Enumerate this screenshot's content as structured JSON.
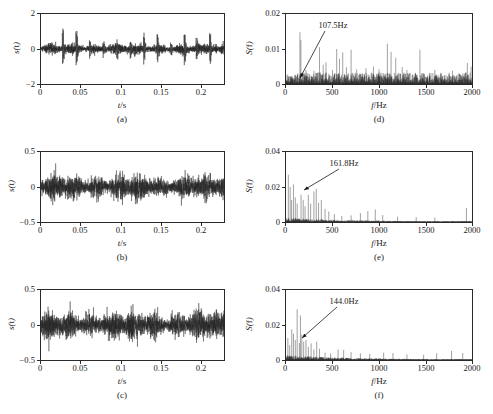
{
  "figure": {
    "layout": "2 columns x 3 rows",
    "columns": [
      "time-domain",
      "frequency-spectrum"
    ]
  },
  "axis_titles": {
    "time_x": "t",
    "time_x_unit": "/s",
    "time_y": "s(t)",
    "freq_x": "f",
    "freq_x_unit": "/Hz",
    "freq_y": "S(f)"
  },
  "captions": {
    "a": "(a)",
    "b": "(b)",
    "c": "(c)",
    "d": "(d)",
    "e": "(e)",
    "f": "(f)"
  },
  "ticks": {
    "time_x": [
      "0",
      "0.05",
      "0.1",
      "0.15",
      "0.2"
    ],
    "freq_x": [
      "0",
      "500",
      "1000",
      "1500",
      "2000"
    ],
    "y_a": [
      "2",
      "0",
      "−2"
    ],
    "y_b": [
      "0.5",
      "0",
      "−0.5"
    ],
    "y_c": [
      "0.5",
      "0",
      "−0.5"
    ],
    "y_d": [
      "0.02",
      "0.01",
      "0"
    ],
    "y_e": [
      "0.04",
      "0.02",
      "0"
    ],
    "y_f": [
      "0.04",
      "0.02",
      "0"
    ]
  },
  "annotations": {
    "d": "107.5Hz",
    "e": "161.8Hz",
    "f": "144.0Hz"
  },
  "colors": {
    "trace": "#262626",
    "axis": "#2a2a2a",
    "background": "#ffffff"
  },
  "chart_data": [
    {
      "id": "a",
      "type": "line",
      "title": "(a)",
      "xlabel": "t/s",
      "ylabel": "s(t)",
      "xlim": [
        0,
        0.23
      ],
      "ylim": [
        -2,
        2
      ],
      "xticks": [
        0,
        0.05,
        0.1,
        0.15,
        0.2
      ],
      "yticks": [
        -2,
        0,
        2
      ],
      "grid": false,
      "legend": "none",
      "description": "Raw vibration signal with periodic impulsive bursts",
      "envelope_peak_times": [
        0.028,
        0.045,
        0.062,
        0.079,
        0.096,
        0.113,
        0.13,
        0.147,
        0.164,
        0.181,
        0.196,
        0.213
      ],
      "envelope_peak_amplitudes": [
        1.25,
        1.45,
        0.55,
        0.62,
        0.7,
        0.52,
        0.9,
        0.95,
        0.48,
        1.1,
        0.7,
        1.05
      ],
      "background_noise_amplitude": 0.28,
      "impulse_period_s": 0.0171
    },
    {
      "id": "b",
      "type": "line",
      "title": "(b)",
      "xlabel": "t/s",
      "ylabel": "s(t)",
      "xlim": [
        0,
        0.23
      ],
      "ylim": [
        -0.5,
        0.5
      ],
      "xticks": [
        0,
        0.05,
        0.1,
        0.15,
        0.2
      ],
      "yticks": [
        -0.5,
        0,
        0.5
      ],
      "grid": false,
      "legend": "none",
      "description": "Noisy signal, fault impulses masked by random noise",
      "background_noise_amplitude": 0.17,
      "max_abs_amplitude": 0.4
    },
    {
      "id": "c",
      "type": "line",
      "title": "(c)",
      "xlabel": "t/s",
      "ylabel": "s(t)",
      "xlim": [
        0,
        0.23
      ],
      "ylim": [
        -0.5,
        0.5
      ],
      "xticks": [
        0,
        0.05,
        0.1,
        0.15,
        0.2
      ],
      "yticks": [
        -0.5,
        0,
        0.5
      ],
      "grid": false,
      "legend": "none",
      "description": "Noisy signal with broadband random content",
      "background_noise_amplitude": 0.19,
      "max_abs_amplitude": 0.43
    },
    {
      "id": "d",
      "type": "line",
      "title": "(d)",
      "xlabel": "f/Hz",
      "ylabel": "S(f)",
      "xlim": [
        0,
        2000
      ],
      "ylim": [
        0,
        0.02
      ],
      "xticks": [
        0,
        500,
        1000,
        1500,
        2000
      ],
      "yticks": [
        0,
        0.01,
        0.02
      ],
      "grid": false,
      "legend": "none",
      "annotation": "107.5Hz",
      "annotation_frequency": 107.5,
      "description": "Spectrum with discrete peaks spread across full 0-2000 Hz band",
      "peaks": [
        {
          "f": 107.5,
          "a": 0.0022
        },
        {
          "f": 150,
          "a": 0.0148
        },
        {
          "f": 160,
          "a": 0.0125
        },
        {
          "f": 215,
          "a": 0.004
        },
        {
          "f": 300,
          "a": 0.0038
        },
        {
          "f": 360,
          "a": 0.0105
        },
        {
          "f": 400,
          "a": 0.0055
        },
        {
          "f": 430,
          "a": 0.0062
        },
        {
          "f": 500,
          "a": 0.004
        },
        {
          "f": 545,
          "a": 0.01
        },
        {
          "f": 575,
          "a": 0.0072
        },
        {
          "f": 610,
          "a": 0.009
        },
        {
          "f": 650,
          "a": 0.0048
        },
        {
          "f": 700,
          "a": 0.0098
        },
        {
          "f": 760,
          "a": 0.0042
        },
        {
          "f": 860,
          "a": 0.0045
        },
        {
          "f": 940,
          "a": 0.005
        },
        {
          "f": 1000,
          "a": 0.0042
        },
        {
          "f": 1090,
          "a": 0.0115
        },
        {
          "f": 1130,
          "a": 0.0092
        },
        {
          "f": 1180,
          "a": 0.0075
        },
        {
          "f": 1250,
          "a": 0.0048
        },
        {
          "f": 1300,
          "a": 0.004
        },
        {
          "f": 1440,
          "a": 0.0098
        },
        {
          "f": 1600,
          "a": 0.004
        },
        {
          "f": 1790,
          "a": 0.0038
        },
        {
          "f": 1950,
          "a": 0.006
        },
        {
          "f": 1990,
          "a": 0.005
        }
      ],
      "noise_floor": 0.0016
    },
    {
      "id": "e",
      "type": "line",
      "title": "(e)",
      "xlabel": "f/Hz",
      "ylabel": "S(f)",
      "xlim": [
        0,
        2000
      ],
      "ylim": [
        0,
        0.04
      ],
      "xticks": [
        0,
        500,
        1000,
        1500,
        2000
      ],
      "yticks": [
        0,
        0.02,
        0.04
      ],
      "grid": false,
      "legend": "none",
      "annotation": "161.8Hz",
      "annotation_frequency": 161.8,
      "description": "Spectrum with energy concentrated below 500 Hz",
      "peaks": [
        {
          "f": 25,
          "a": 0.027
        },
        {
          "f": 45,
          "a": 0.02
        },
        {
          "f": 60,
          "a": 0.0125
        },
        {
          "f": 80,
          "a": 0.0215
        },
        {
          "f": 100,
          "a": 0.014
        },
        {
          "f": 120,
          "a": 0.0105
        },
        {
          "f": 161.8,
          "a": 0.0155
        },
        {
          "f": 185,
          "a": 0.0125
        },
        {
          "f": 205,
          "a": 0.009
        },
        {
          "f": 240,
          "a": 0.0155
        },
        {
          "f": 265,
          "a": 0.0105
        },
        {
          "f": 300,
          "a": 0.0175
        },
        {
          "f": 325,
          "a": 0.019
        },
        {
          "f": 350,
          "a": 0.011
        },
        {
          "f": 380,
          "a": 0.0125
        },
        {
          "f": 420,
          "a": 0.0075
        },
        {
          "f": 460,
          "a": 0.006
        },
        {
          "f": 520,
          "a": 0.0045
        },
        {
          "f": 600,
          "a": 0.0035
        },
        {
          "f": 700,
          "a": 0.0038
        },
        {
          "f": 800,
          "a": 0.005
        },
        {
          "f": 880,
          "a": 0.0062
        },
        {
          "f": 960,
          "a": 0.0072
        },
        {
          "f": 1040,
          "a": 0.004
        },
        {
          "f": 1200,
          "a": 0.003
        },
        {
          "f": 1400,
          "a": 0.0028
        },
        {
          "f": 1600,
          "a": 0.0025
        },
        {
          "f": 1940,
          "a": 0.008
        }
      ],
      "noise_floor": 0.0012
    },
    {
      "id": "f",
      "type": "line",
      "title": "(f)",
      "xlabel": "f/Hz",
      "ylabel": "S(f)",
      "xlim": [
        0,
        2000
      ],
      "ylim": [
        0,
        0.04
      ],
      "xticks": [
        0,
        500,
        1000,
        1500,
        2000
      ],
      "yticks": [
        0,
        0.02,
        0.04
      ],
      "grid": false,
      "legend": "none",
      "annotation": "144.0Hz",
      "annotation_frequency": 144.0,
      "description": "Spectrum with dominant low-frequency peaks below 400 Hz",
      "peaks": [
        {
          "f": 20,
          "a": 0.0125
        },
        {
          "f": 40,
          "a": 0.0085
        },
        {
          "f": 62,
          "a": 0.0175
        },
        {
          "f": 80,
          "a": 0.015
        },
        {
          "f": 100,
          "a": 0.0115
        },
        {
          "f": 120,
          "a": 0.029
        },
        {
          "f": 144,
          "a": 0.0098
        },
        {
          "f": 155,
          "a": 0.0255
        },
        {
          "f": 170,
          "a": 0.0145
        },
        {
          "f": 190,
          "a": 0.0105
        },
        {
          "f": 215,
          "a": 0.0115
        },
        {
          "f": 240,
          "a": 0.0075
        },
        {
          "f": 270,
          "a": 0.0095
        },
        {
          "f": 300,
          "a": 0.006
        },
        {
          "f": 330,
          "a": 0.0105
        },
        {
          "f": 360,
          "a": 0.0065
        },
        {
          "f": 420,
          "a": 0.0042
        },
        {
          "f": 480,
          "a": 0.0038
        },
        {
          "f": 560,
          "a": 0.006
        },
        {
          "f": 620,
          "a": 0.0058
        },
        {
          "f": 700,
          "a": 0.0045
        },
        {
          "f": 800,
          "a": 0.0038
        },
        {
          "f": 900,
          "a": 0.0035
        },
        {
          "f": 1050,
          "a": 0.0042
        },
        {
          "f": 1150,
          "a": 0.004
        },
        {
          "f": 1300,
          "a": 0.0032
        },
        {
          "f": 1480,
          "a": 0.003
        },
        {
          "f": 1620,
          "a": 0.0038
        },
        {
          "f": 1780,
          "a": 0.0052
        },
        {
          "f": 1900,
          "a": 0.004
        }
      ],
      "noise_floor": 0.0014
    }
  ]
}
